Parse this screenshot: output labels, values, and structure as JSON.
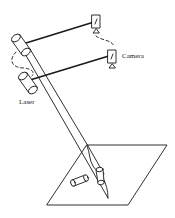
{
  "diagram": {
    "labels": {
      "camera": "Camera",
      "laser": "Laser"
    },
    "components": [
      {
        "type": "laser-emitter",
        "id": "laser-1"
      },
      {
        "type": "laser-emitter",
        "id": "laser-2"
      },
      {
        "type": "camera",
        "id": "camera-1"
      },
      {
        "type": "camera",
        "id": "camera-2"
      },
      {
        "type": "laser-beam",
        "id": "beam-pair"
      },
      {
        "type": "surface-plane",
        "id": "work-plane"
      },
      {
        "type": "object",
        "id": "object-cylinder-1"
      },
      {
        "type": "object",
        "id": "object-cylinder-2"
      }
    ],
    "connections": [
      {
        "from": "laser-1",
        "to": "camera-1",
        "style": "solid"
      },
      {
        "from": "laser-2",
        "to": "camera-2",
        "style": "solid"
      },
      {
        "from": "laser-1",
        "to": "laser-2",
        "style": "dashed"
      },
      {
        "from": "camera-1",
        "to": "camera-2",
        "style": "dashed"
      }
    ],
    "colors": {
      "stroke": "#1a1a1a",
      "background": "#ffffff"
    }
  }
}
